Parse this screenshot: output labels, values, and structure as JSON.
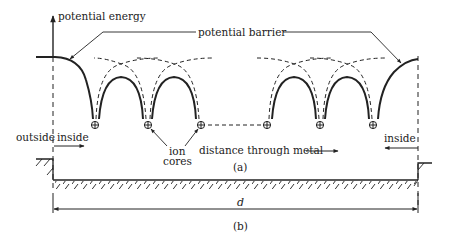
{
  "figure": {
    "axis_label": "potential energy",
    "barrier_label": "potential barrier",
    "outside_label": "outside",
    "inside_left_label": "inside",
    "inside_right_label": "inside",
    "ion_cores_label_line1": "ion",
    "ion_cores_label_line2": "cores",
    "distance_label": "distance through metal",
    "panel_a_label": "(a)",
    "panel_b_label": "(b)",
    "length_label": "d",
    "ion_symbol": "⊕",
    "ion_count": 6,
    "colors": {
      "ink": "#222222",
      "background": "#ffffff"
    }
  }
}
